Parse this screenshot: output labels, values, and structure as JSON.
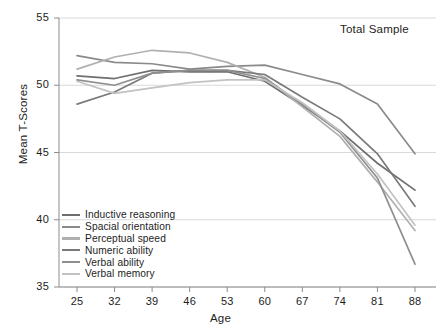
{
  "chart_data": {
    "type": "line",
    "title": "",
    "annotation": "Total Sample",
    "xlabel": "Age",
    "ylabel": "Mean T-Scores",
    "x": [
      25,
      32,
      39,
      46,
      53,
      60,
      67,
      74,
      81,
      88
    ],
    "xtick_labels": [
      "25",
      "32",
      "39",
      "46",
      "53",
      "60",
      "67",
      "74",
      "81",
      "88"
    ],
    "ytick_labels": [
      "35",
      "40",
      "45",
      "50",
      "55"
    ],
    "yticks": [
      35,
      40,
      45,
      50,
      55
    ],
    "xlim": [
      25,
      88
    ],
    "ylim": [
      35,
      55
    ],
    "grid": "horizontal",
    "legend_position": "bottom-left",
    "series": [
      {
        "name": "Inductive reasoning",
        "color": "#6f6f6f",
        "values": [
          50.7,
          50.5,
          51.1,
          51.0,
          51.0,
          50.3,
          48.5,
          46.6,
          44.2,
          42.2
        ]
      },
      {
        "name": "Spacial orientation",
        "color": "#8a8a8a",
        "values": [
          52.2,
          51.7,
          51.6,
          51.2,
          51.4,
          51.5,
          50.8,
          50.1,
          48.6,
          44.9
        ]
      },
      {
        "name": "Perceptual speed",
        "color": "#b0b0b0",
        "values": [
          51.2,
          52.1,
          52.6,
          52.4,
          51.7,
          50.6,
          48.4,
          46.2,
          42.8,
          39.2
        ]
      },
      {
        "name": "Numeric ability",
        "color": "#7a7a7a",
        "values": [
          48.6,
          49.5,
          50.9,
          51.1,
          51.1,
          50.8,
          49.1,
          47.5,
          44.9,
          41.0
        ]
      },
      {
        "name": "Verbal ability",
        "color": "#8f8f8f",
        "values": [
          50.4,
          50.0,
          50.9,
          51.1,
          51.1,
          50.5,
          48.6,
          46.5,
          43.1,
          36.7
        ]
      },
      {
        "name": "Verbal memory",
        "color": "#c2c2c2",
        "values": [
          50.3,
          49.4,
          49.8,
          50.2,
          50.4,
          50.4,
          48.7,
          46.6,
          43.4,
          39.6
        ]
      }
    ]
  },
  "axis": {
    "y_title": "Mean T-Scores",
    "x_title": "Age"
  },
  "colors": {
    "grid": "#cfcfcf",
    "axis": "#8c8c8c",
    "text": "#1d1d1d",
    "background": "#ffffff"
  }
}
